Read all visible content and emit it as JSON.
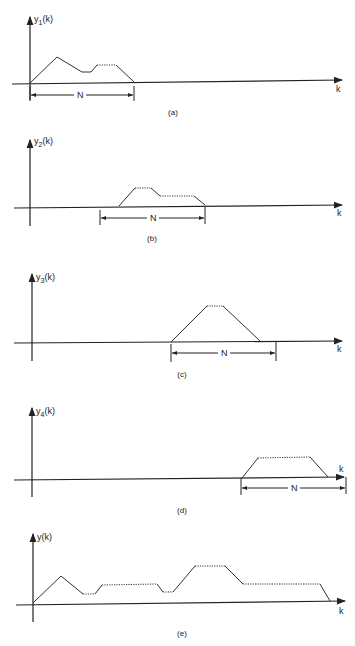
{
  "figure": {
    "panels": [
      {
        "id": "a",
        "caption": "(a)",
        "ylabel_main": "y",
        "ylabel_sub": "1",
        "ylabel_tail": "(k)",
        "xlabel": "k",
        "bracket_label": "N"
      },
      {
        "id": "b",
        "caption": "(b)",
        "ylabel_main": "y",
        "ylabel_sub": "2",
        "ylabel_tail": "(k)",
        "xlabel": "k",
        "bracket_label": "N"
      },
      {
        "id": "c",
        "caption": "(c)",
        "ylabel_main": "y",
        "ylabel_sub": "3",
        "ylabel_tail": "(k)",
        "xlabel": "k",
        "bracket_label": "N"
      },
      {
        "id": "d",
        "caption": "(d)",
        "ylabel_main": "y",
        "ylabel_sub": "4",
        "ylabel_tail": "(k)",
        "xlabel": "k",
        "bracket_label": "N"
      },
      {
        "id": "e",
        "caption": "(e)",
        "ylabel_main": "y",
        "ylabel_sub": "",
        "ylabel_tail": "(k)",
        "xlabel": "k",
        "bracket_label": ""
      }
    ]
  }
}
